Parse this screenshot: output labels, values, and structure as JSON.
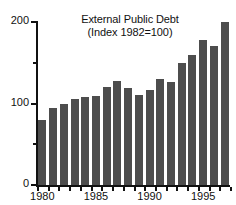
{
  "chart_data": {
    "type": "bar",
    "title": "External Public Debt",
    "subtitle": "(Index 1982=100)",
    "xlabel": "",
    "ylabel": "",
    "categories": [
      "1980",
      "1981",
      "1982",
      "1983",
      "1984",
      "1985",
      "1986",
      "1987",
      "1988",
      "1989",
      "1990",
      "1991",
      "1992",
      "1993",
      "1994",
      "1995",
      "1996",
      "1997"
    ],
    "values": [
      80,
      95,
      100,
      105,
      108,
      109,
      120,
      128,
      119,
      110,
      117,
      130,
      127,
      150,
      160,
      178,
      170,
      200
    ],
    "ylim": [
      0,
      200
    ],
    "yticks": [
      0,
      100,
      200
    ],
    "ytick_labels": [
      "0",
      "100",
      "200"
    ],
    "yminor_ticks": [
      50,
      150
    ],
    "xtick_labels": [
      "1980",
      "1985",
      "1990",
      "1995"
    ],
    "xtick_categories": [
      "1980",
      "1985",
      "1990",
      "1995"
    ],
    "grid": false,
    "legend": null,
    "bar_color": "#4d4d4d",
    "axis_color": "#111111",
    "background": "#ffffff"
  }
}
